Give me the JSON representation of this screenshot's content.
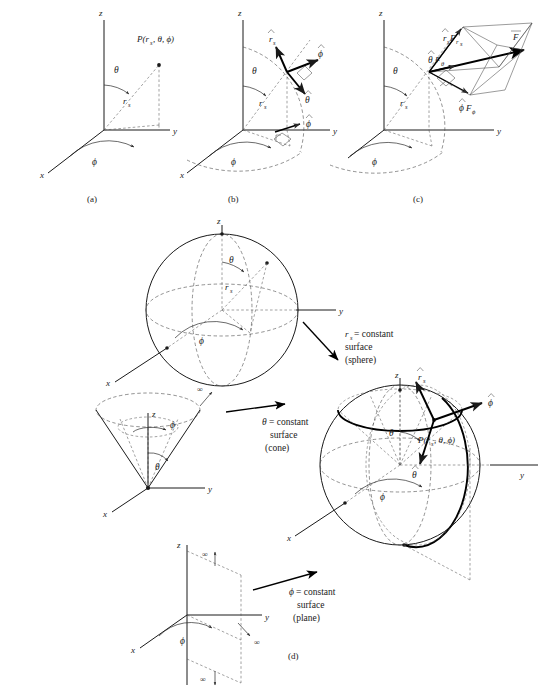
{
  "figure": {
    "panels": [
      {
        "id": "a",
        "label": "(a)"
      },
      {
        "id": "b",
        "label": "(b)"
      },
      {
        "id": "c",
        "label": "(c)"
      },
      {
        "id": "d",
        "label": "(d)"
      }
    ]
  },
  "axes": {
    "x": "x",
    "y": "y",
    "z": "z"
  },
  "symbols": {
    "theta": "θ",
    "phi": "ϕ",
    "r_s": "r",
    "r_sub": "s",
    "infinity": "∞",
    "P_open": "P(",
    "P_close": ")",
    "comma": ",",
    "F": "F"
  },
  "panel_a": {
    "point_label_main": "P(r",
    "point_label_sub": "s",
    "point_label_rest": ", θ, ϕ)",
    "radial_label": "r",
    "radial_sub": "s",
    "theta_label": "θ",
    "phi_label": "ϕ",
    "caption": "(a)"
  },
  "panel_b": {
    "unit_r": "r",
    "unit_r_sub": "s",
    "unit_phi": "ϕ",
    "unit_theta": "θ",
    "unit_phi_ground": "ϕ",
    "radial_label": "r",
    "radial_sub": "s",
    "theta_label": "θ",
    "phi_label": "ϕ",
    "caption": "(b)"
  },
  "panel_c": {
    "comp_r_main": "r",
    "comp_r_sub": "s",
    "comp_r_F": "F",
    "comp_r_Fsub": "r",
    "comp_r_Fsub2": "s",
    "comp_theta_main": "θ",
    "comp_theta_F": "F",
    "comp_theta_sub": "θ",
    "comp_phi_main": "ϕ",
    "comp_phi_F": "F",
    "comp_phi_sub": "ϕ",
    "vector_F": "F",
    "radial_label": "r",
    "radial_sub": "s",
    "theta_label": "θ",
    "phi_label": "ϕ",
    "caption": "(c)"
  },
  "panel_d": {
    "caption": "(d)",
    "sphere": {
      "theta_label": "θ",
      "phi_label": "ϕ",
      "radial_label": "r",
      "radial_sub": "s",
      "callout_line1_sym": "r",
      "callout_line1_sub": "s",
      "callout_line1_rest": " = constant",
      "callout_line2": "surface",
      "callout_line3": "(sphere)"
    },
    "cone": {
      "theta_label": "θ",
      "phi_label": "ϕ",
      "infinity": "∞",
      "callout_line1_sym": "θ",
      "callout_line1_rest": " = constant",
      "callout_line2": "surface",
      "callout_line3": "(cone)"
    },
    "plane": {
      "phi_label": "ϕ",
      "infinity": "∞",
      "callout_line1_sym": "ϕ",
      "callout_line1_rest": " = constant",
      "callout_line2": "surface",
      "callout_line3": "(plane)"
    },
    "combined": {
      "unit_r": "r",
      "unit_r_sub": "s",
      "unit_phi": "ϕ",
      "unit_theta": "θ",
      "theta_label": "θ",
      "phi_label": "ϕ",
      "point_label_main": "P(r",
      "point_label_sub": "s",
      "point_label_rest": ", θ, ϕ)"
    }
  },
  "colors": {
    "ink": "#1a1a1a",
    "dashed": "#4a4a4a",
    "background": "#ffffff"
  }
}
